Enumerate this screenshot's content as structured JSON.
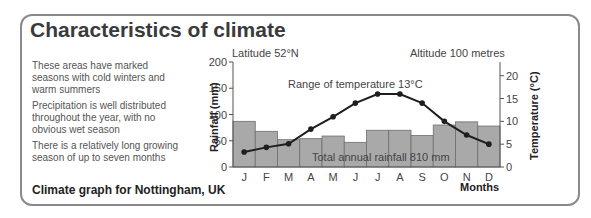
{
  "title": "Characteristics of climate",
  "notes": [
    "These areas have marked seasons with cold winters and warm summers",
    "Precipitation is well distributed throughout the year, with no obvious wet season",
    "There is a relatively long growing season of up to seven months"
  ],
  "caption": "Climate graph for Nottingham, UK",
  "chart_data": {
    "type": "bar",
    "title": "Climate graph for Nottingham, UK",
    "categories": [
      "J",
      "F",
      "M",
      "A",
      "M",
      "J",
      "J",
      "A",
      "S",
      "O",
      "N",
      "D"
    ],
    "series": [
      {
        "name": "Rainfall (mm)",
        "type": "bar",
        "axis": "left",
        "values": [
          87,
          68,
          52,
          54,
          59,
          47,
          70,
          70,
          60,
          80,
          86,
          78
        ]
      },
      {
        "name": "Temperature (°C)",
        "type": "line",
        "axis": "right",
        "values": [
          3.3,
          4.3,
          5.1,
          8.3,
          11,
          14,
          16,
          16,
          14,
          10,
          7,
          5
        ]
      }
    ],
    "xlabel": "Months",
    "ylabel": "Rainfall (mm)",
    "y2label": "Temperature (°C)",
    "ylim": [
      0,
      200
    ],
    "y2lim": [
      0,
      23
    ],
    "yticks": [
      0,
      50,
      100,
      150,
      200
    ],
    "y2ticks": [
      0,
      5,
      10,
      15,
      20
    ],
    "annotations": {
      "latitude": "Latitude 52°N",
      "altitude": "Altitude 100 metres",
      "range": "Range of temperature 13°C",
      "total": "Total annual rainfall 810 mm"
    },
    "colors": {
      "bar": "#a9a9a9",
      "bar_edge": "#6e6e6e",
      "line": "#1e1e1e"
    }
  }
}
